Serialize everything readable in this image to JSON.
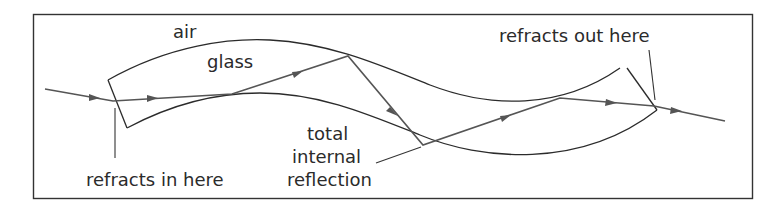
{
  "diagram": {
    "labels": {
      "air": "air",
      "glass": "glass",
      "refracts_in": "refracts in here",
      "refracts_out": "refracts out here",
      "tir_line1": "total",
      "tir_line2": "internal",
      "tir_line3": "reflection"
    },
    "media": [
      "air",
      "glass"
    ],
    "colors": {
      "line": "#2b2b2b",
      "ray": "#555555",
      "background": "#ffffff"
    }
  }
}
